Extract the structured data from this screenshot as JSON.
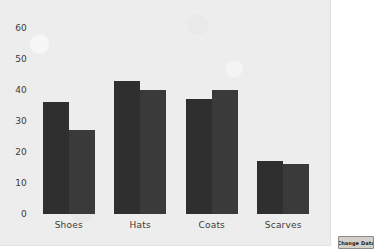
{
  "chart_data": {
    "type": "bar",
    "title": "",
    "xlabel": "",
    "ylabel": "",
    "categories": [
      "Shoes",
      "Hats",
      "Coats",
      "Scarves"
    ],
    "series": [
      {
        "name": "Series 1",
        "values": [
          36,
          43,
          37,
          17
        ],
        "color": "#2f2f2f"
      },
      {
        "name": "Series 2",
        "values": [
          27,
          40,
          40,
          16
        ],
        "color": "#3a3a3a"
      }
    ],
    "ylim": [
      0,
      60
    ],
    "yticks": [
      0,
      10,
      20,
      30,
      40,
      50,
      60
    ],
    "ytick_labels": [
      "0",
      "10",
      "20",
      "30",
      "40",
      "50",
      "60"
    ],
    "grid": false,
    "legend": "none",
    "background_color": "#ededed"
  },
  "controls": {
    "change_data_label": "Change Data"
  }
}
